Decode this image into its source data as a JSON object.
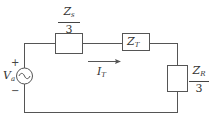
{
  "diagram": {
    "type": "circuit",
    "source": {
      "label_main": "V",
      "label_sub": "a",
      "plus": "+",
      "minus": "−",
      "kind": "ac-voltage-source"
    },
    "components": [
      {
        "id": "zs",
        "numerator_main": "Z",
        "numerator_sub": "s",
        "denominator": "3"
      },
      {
        "id": "zt",
        "label_main": "Z",
        "label_sub": "T"
      },
      {
        "id": "zr",
        "numerator_main": "Z",
        "numerator_sub": "R",
        "denominator": "3"
      }
    ],
    "current": {
      "label_main": "I",
      "label_sub": "T",
      "direction": "right"
    },
    "colors": {
      "wire": "#555555",
      "text": "#333333",
      "background": "#ffffff"
    }
  }
}
